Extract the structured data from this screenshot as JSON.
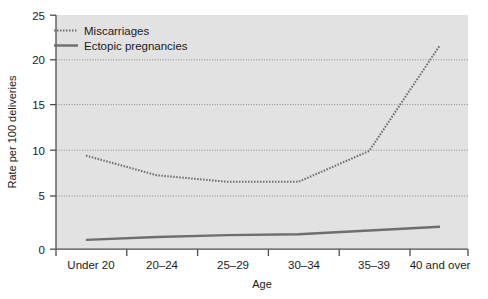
{
  "chart_data": {
    "type": "line",
    "title": "",
    "xlabel": "Age",
    "ylabel": "Rate per 100 deliveries",
    "categories": [
      "Under 20",
      "20–24",
      "25–29",
      "30–34",
      "35–39",
      "40 and over"
    ],
    "ylim": [
      0,
      25
    ],
    "yticks": [
      0,
      5,
      10,
      15,
      20,
      25
    ],
    "ytick_labels": [
      "0",
      "5",
      "10",
      "15",
      "20",
      "25"
    ],
    "grid": true,
    "grid_axis": "y",
    "legend_position": "top-left",
    "plot_background": "#e2e2e2",
    "series": [
      {
        "name": "Miscarriages",
        "style": "dotted",
        "color": "#6e6e6e",
        "values": [
          10.0,
          7.9,
          7.2,
          7.2,
          10.5,
          21.8
        ]
      },
      {
        "name": "Ectopic pregnancies",
        "style": "solid",
        "color": "#6e6e6e",
        "values": [
          1.0,
          1.3,
          1.5,
          1.6,
          2.0,
          2.4
        ]
      }
    ]
  },
  "axis": {
    "y_title": "Rate per 100 deliveries",
    "x_title": "Age"
  },
  "legend": {
    "items": [
      {
        "label": "Miscarriages",
        "marker": "dotted-line-swatch"
      },
      {
        "label": "Ectopic pregnancies",
        "marker": "solid-line-swatch"
      }
    ]
  },
  "yticks": [
    {
      "label": "25"
    },
    {
      "label": "20"
    },
    {
      "label": "15"
    },
    {
      "label": "10"
    },
    {
      "label": "5"
    },
    {
      "label": "0"
    }
  ],
  "xticks": [
    {
      "label": "Under 20"
    },
    {
      "label": "20–24"
    },
    {
      "label": "25–29"
    },
    {
      "label": "30–34"
    },
    {
      "label": "35–39"
    },
    {
      "label": "40 and over"
    }
  ]
}
